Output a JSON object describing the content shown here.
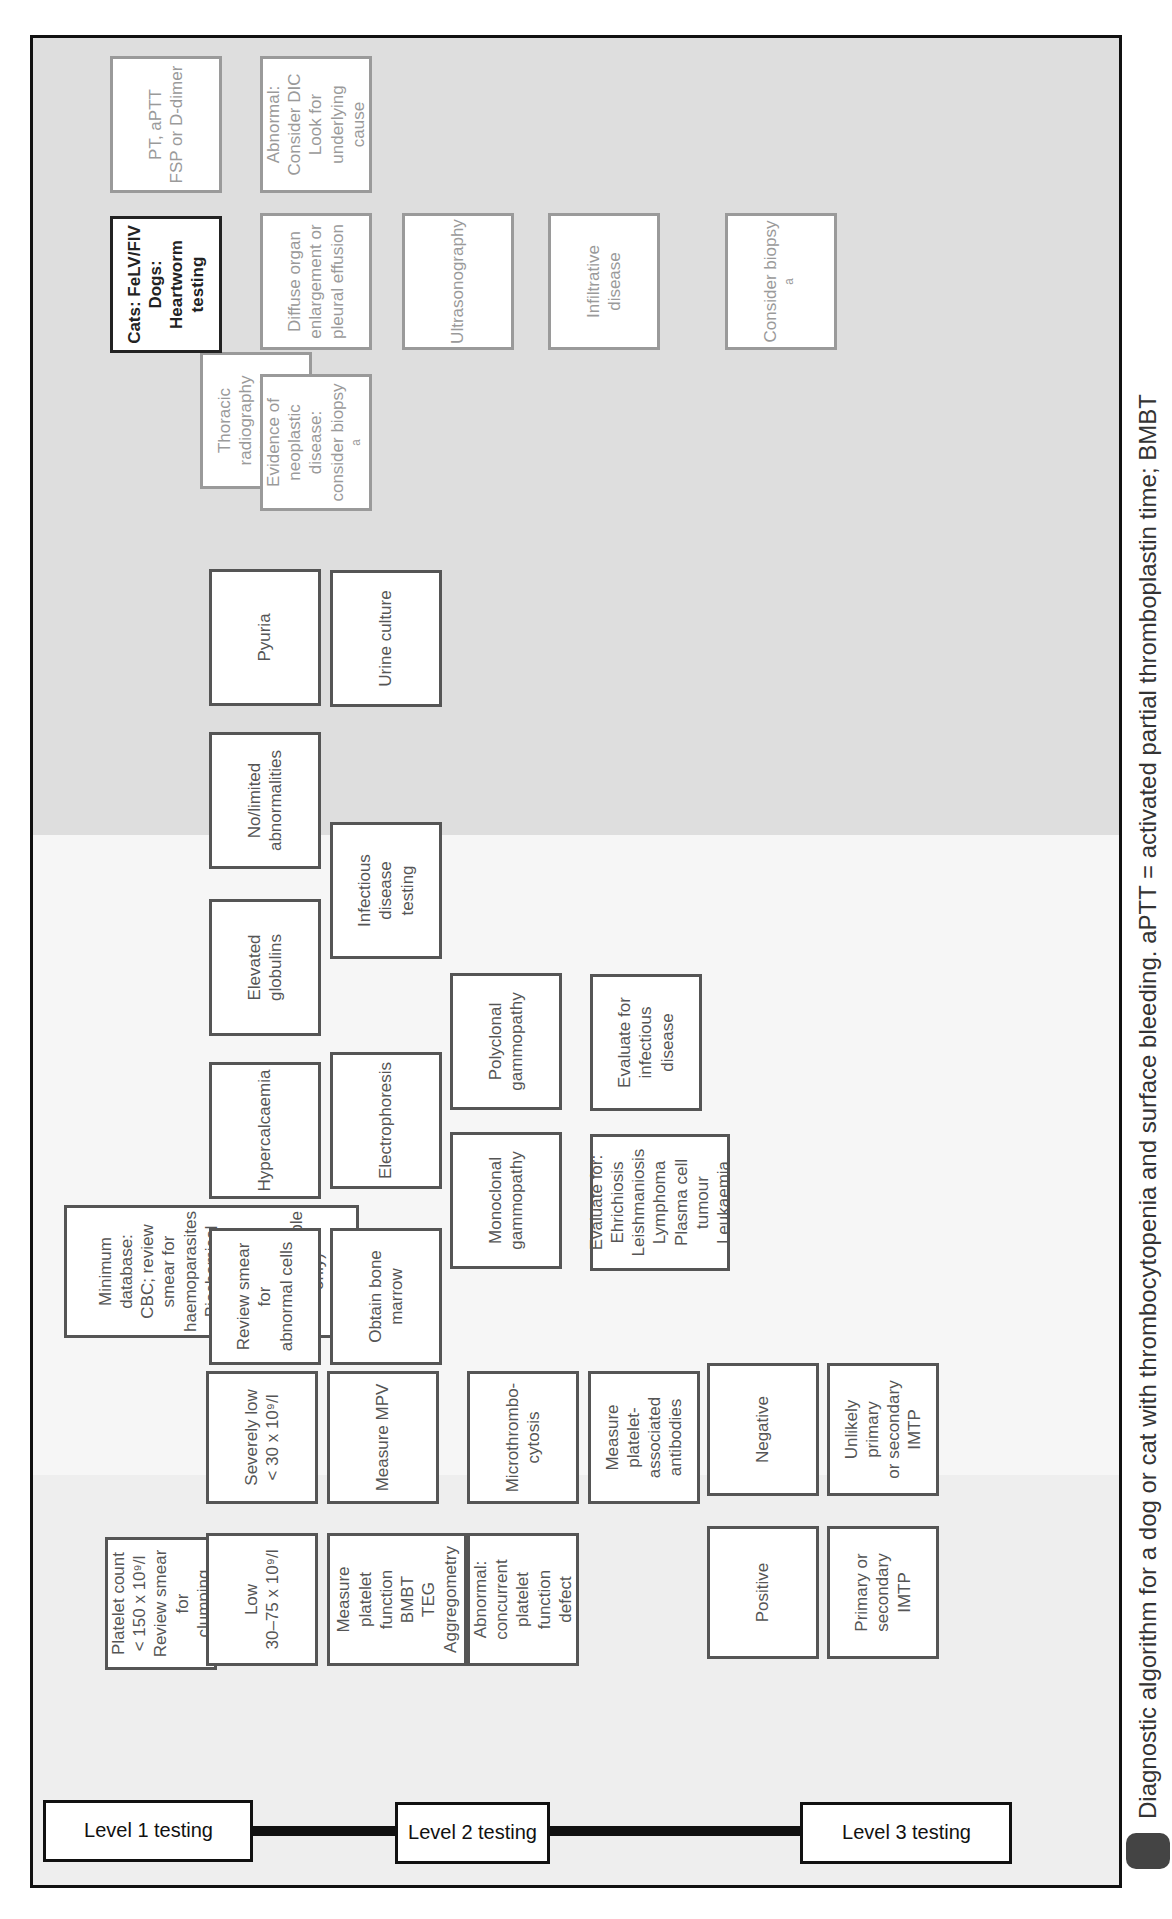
{
  "levels": {
    "level1": "Level 1 testing",
    "level2": "Level 2 testing",
    "level3": "Level 3 testing"
  },
  "nodes": {
    "platelet_count": "Platelet count\n< 150 x 10⁹/l\nReview smear for\nclumping",
    "low": "Low\n30–75 x 10⁹/l",
    "severely_low": "Severely low\n< 30 x 10⁹/l",
    "measure_platelet_function": "Measure platelet\nfunction\nBMBT\nTEG\nAggregometry",
    "measure_mpv": "Measure MPV",
    "abnormal_platelet_function": "Abnormal:\nconcurrent\nplatelet function\ndefect",
    "microthrombocytosis": "Microthrombo-\ncytosis",
    "measure_antibodies": "Measure platelet-\nassociated\nantibodies",
    "positive": "Positive",
    "negative": "Negative",
    "primary_secondary_imtp": "Primary or\nsecondary IMTP",
    "unlikely_imtp": "Unlikely primary\nor secondary\nIMTP",
    "minimum_database": "Minimum database:\nCBC; review smear for haemoparasites\nBiochemical profile\nUrinalysis (voided or catheter sample only)",
    "review_smear_abnormal": "Review smear for\nabnormal cells",
    "hypercalcaemia": "Hypercalcaemia",
    "elevated_globulins": "Elevated\nglobulins",
    "no_limited_abnormalities": "No/limited\nabnormalities",
    "pyuria": "Pyuria",
    "obtain_bone_marrow": "Obtain bone\nmarrow",
    "electrophoresis": "Electrophoresis",
    "infectious_disease_testing": "Infectious disease\ntesting",
    "urine_culture": "Urine culture",
    "monoclonal_gammopathy": "Monoclonal\ngammopathy",
    "polyclonal_gammopathy": "Polyclonal\ngammopathy",
    "evaluate_for_list": "Evaluate for:\nEhrichiosis\nLeishmaniosis\nLymphoma\nPlasma cell\ntumour\nLeukaemia",
    "evaluate_infectious": "Evaluate for\ninfectious\ndisease",
    "radiography": "Thoracic\nradiography\nAbdominal\nradiography",
    "neoplastic_evidence": "Evidence of\nneoplastic\ndisease:\nconsider biopsy ᵃ",
    "diffuse_organ": "Diffuse organ\nenlargement or\npleural effusion",
    "ultrasonography": "Ultrasonography",
    "infiltrative_disease": "Infiltrative disease",
    "consider_biopsy": "Consider biopsy ᵃ",
    "felv_heartworm": "Cats: FeLV/FIV\nDogs: Heartworm\ntesting",
    "pt_aptt": "PT, aPTT\nFSP or D-dimer",
    "abnormal_dic": "Abnormal:\nConsider DIC\nLook for\nunderlying cause"
  },
  "caption": "Diagnostic algorithm for a dog or cat with thrombocytopenia and surface bleeding. aPTT = activated partial thromboplastin time; BMBT",
  "colors": {
    "frame": "#111111",
    "box_border": "#555555",
    "faded_border": "#9a9a9a",
    "band_level1": "#efefef",
    "band_level2": "#f7f7f7",
    "band_level3": "#e0e0e0"
  }
}
